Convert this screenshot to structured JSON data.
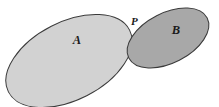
{
  "figure": {
    "background_color": "#ffffff",
    "width": 219,
    "height": 107
  },
  "shapes": {
    "ellipse_a": {
      "label": "A",
      "fill_color": "#d2d2d2",
      "stroke_color": "#3a3a3a",
      "stroke_width": 1,
      "center_x": 69,
      "center_y": 61,
      "radius_x": 68,
      "radius_y": 39,
      "rotation_deg": -27,
      "label_x": 77,
      "label_y": 44
    },
    "ellipse_b": {
      "label": "B",
      "fill_color": "#a8a8a8",
      "stroke_color": "#3a3a3a",
      "stroke_width": 1,
      "center_x": 168,
      "center_y": 38,
      "radius_x": 44,
      "radius_y": 25,
      "rotation_deg": -27,
      "label_x": 176,
      "label_y": 34
    },
    "tangency_point": {
      "label": "P",
      "x": 128,
      "y": 22,
      "label_x": 131,
      "label_y": 25
    }
  },
  "colors": {
    "fill_light_gray": "#d2d2d2",
    "fill_dark_gray": "#a8a8a8",
    "outline": "#3a3a3a",
    "label_text": "#1a1a1a",
    "background": "#ffffff"
  },
  "chart_data": {
    "type": "diagram",
    "elements": [
      {
        "name": "A",
        "kind": "ellipse",
        "shade": "light gray",
        "relative_size": "large"
      },
      {
        "name": "B",
        "kind": "ellipse",
        "shade": "dark gray",
        "relative_size": "small"
      },
      {
        "name": "P",
        "kind": "point",
        "description": "tangency point where ellipse A and ellipse B touch"
      }
    ],
    "relations": [
      {
        "from": "A",
        "to": "B",
        "type": "externally tangent at P"
      }
    ]
  }
}
